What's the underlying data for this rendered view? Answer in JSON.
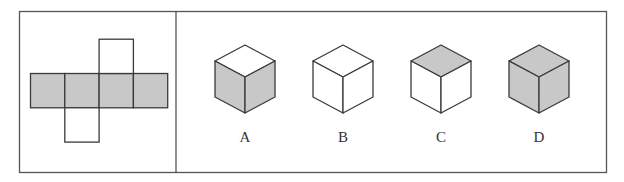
{
  "figure": {
    "type": "cube-net-puzzle",
    "colors": {
      "line": "#3a3a3a",
      "shade": "#c8c8c8",
      "background": "#ffffff"
    },
    "net": {
      "description": "Cross-shaped net: row of 4 shaded squares, one white square above the 3rd, one white square below the 2nd",
      "row_squares": [
        {
          "shaded": true
        },
        {
          "shaded": true
        },
        {
          "shaded": true
        },
        {
          "shaded": true
        }
      ],
      "top_flap": {
        "above_index": 2,
        "shaded": false
      },
      "bottom_flap": {
        "below_index": 1,
        "shaded": false
      }
    },
    "options": [
      {
        "label": "A",
        "top_shaded": false,
        "left_shaded": true,
        "right_shaded": true
      },
      {
        "label": "B",
        "top_shaded": false,
        "left_shaded": false,
        "right_shaded": false
      },
      {
        "label": "C",
        "top_shaded": true,
        "left_shaded": false,
        "right_shaded": false
      },
      {
        "label": "D",
        "top_shaded": true,
        "left_shaded": true,
        "right_shaded": true
      }
    ]
  }
}
